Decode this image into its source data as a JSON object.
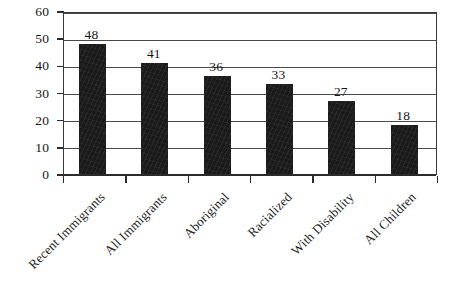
{
  "chart_data": {
    "type": "bar",
    "title": "",
    "subtitle": "",
    "xlabel": "",
    "ylabel": "",
    "categories": [
      "Recent Immigrants",
      "All Immigrants",
      "Aboriginal",
      "Racialized",
      "With Disability",
      "All Children"
    ],
    "values": [
      48,
      41,
      36,
      33,
      27,
      18
    ],
    "value_labels": [
      "48",
      "41",
      "36",
      "33",
      "27",
      "18"
    ],
    "ylim": [
      0,
      60
    ],
    "ytick_step": 10,
    "ytick_labels": [
      "60",
      "50",
      "40",
      "30",
      "20",
      "10",
      "0"
    ],
    "ytick_values": [
      60,
      50,
      40,
      30,
      20,
      10,
      0
    ],
    "grid": true,
    "grid_axis": "y",
    "legend": false,
    "legend_position": "none",
    "bar_color": "#1a1a1a",
    "grid_color": "#4a4a4a",
    "axis_color": "#2b2b2b",
    "background_color": "#ffffff",
    "text_color": "#161616",
    "label_rotation_degrees": -45
  }
}
